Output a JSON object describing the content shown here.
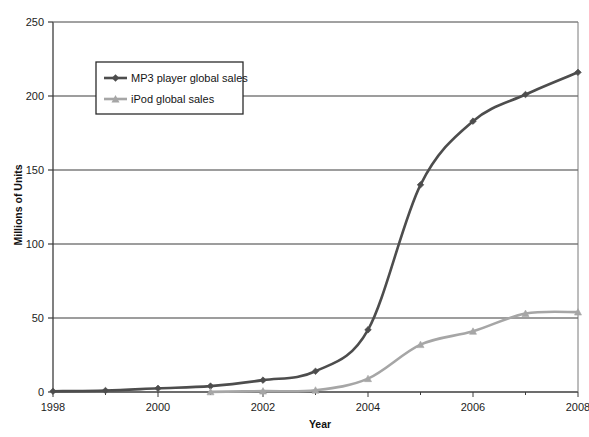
{
  "chart_data": {
    "type": "line",
    "title": "",
    "xlabel": "Year",
    "ylabel": "Millions of Units",
    "x": [
      1998,
      1999,
      2000,
      2001,
      2002,
      2003,
      2004,
      2005,
      2006,
      2007,
      2008
    ],
    "xlim": [
      1998,
      2008
    ],
    "ylim": [
      0,
      250
    ],
    "xticks": [
      1998,
      2000,
      2002,
      2004,
      2006,
      2008
    ],
    "xtick_labels": [
      "1998",
      "2000",
      "2002",
      "2004",
      "2006",
      "2008"
    ],
    "yticks": [
      0,
      50,
      100,
      150,
      200,
      250
    ],
    "ytick_labels": [
      "0",
      "50",
      "100",
      "150",
      "200",
      "250"
    ],
    "grid": "horizontal",
    "legend_position": "upper-left-inside",
    "series": [
      {
        "name": "MP3 player global sales",
        "color": "#4d4d4d",
        "marker": "diamond",
        "x": [
          1998,
          1999,
          2000,
          2001,
          2002,
          2003,
          2004,
          2005,
          2006,
          2007,
          2008
        ],
        "values": [
          0.5,
          1,
          2.5,
          4,
          8,
          14,
          42,
          140,
          183,
          201,
          216
        ]
      },
      {
        "name": "iPod global sales",
        "color": "#a6a6a6",
        "marker": "triangle",
        "x": [
          2001,
          2002,
          2003,
          2004,
          2005,
          2006,
          2007,
          2008
        ],
        "values": [
          0.1,
          0.6,
          1.2,
          9,
          32,
          41,
          53,
          54
        ]
      }
    ]
  },
  "legend": {
    "entries": [
      {
        "label": "MP3 player global sales"
      },
      {
        "label": "iPod global sales"
      }
    ]
  },
  "axes": {
    "x_title": "Year",
    "y_title": "Millions of Units"
  },
  "colors": {
    "series_mp3": "#4d4d4d",
    "series_ipod": "#a6a6a6",
    "axis": "#3c3c3c",
    "grid": "#3c3c3c",
    "background": "#ffffff"
  }
}
